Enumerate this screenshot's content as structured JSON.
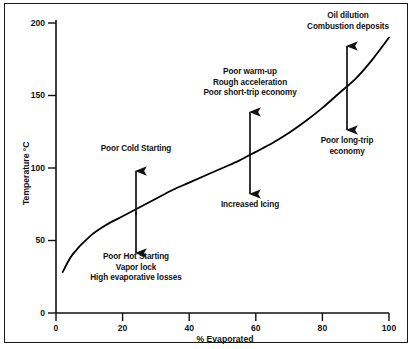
{
  "chart_data": {
    "type": "line",
    "title": "",
    "subtitle": "",
    "xlabel": "% Evaporated",
    "ylabel": "Temperature °C",
    "xlim": [
      0,
      100
    ],
    "ylim": [
      0,
      200
    ],
    "xticks": [
      0,
      20,
      40,
      60,
      80,
      100
    ],
    "yticks": [
      0,
      50,
      100,
      150,
      200
    ],
    "xtick_labels": [
      "0",
      "20",
      "40",
      "60",
      "80",
      "100"
    ],
    "ytick_labels": [
      "0",
      "50",
      "100",
      "150",
      "200"
    ],
    "grid": false,
    "legend": null,
    "series": [
      {
        "name": "Gasoline distillation curve",
        "color": "#000000",
        "x": [
          2,
          5,
          10,
          15,
          20,
          25,
          30,
          35,
          40,
          45,
          50,
          55,
          60,
          65,
          70,
          75,
          80,
          85,
          90,
          95,
          100
        ],
        "y": [
          28,
          40,
          52,
          60,
          66,
          72,
          78,
          84,
          89,
          94,
          99,
          104,
          110,
          116,
          123,
          131,
          140,
          150,
          160,
          173,
          188
        ]
      }
    ],
    "annotations": [
      {
        "id": "poor-cold-starting",
        "text": "Poor Cold Starting",
        "x": 23,
        "y": 130,
        "arrow": "up",
        "arrow_x": 23
      },
      {
        "id": "poor-hot-starting",
        "text": "Poor Hot Starting\nVapor lock\nHigh evaporative losses",
        "x": 23,
        "y": 22,
        "arrow": "down",
        "arrow_x": 23
      },
      {
        "id": "poor-warm-up",
        "text": "Poor warm-up\nRough acceleration\nPoor short-trip economy",
        "x": 58,
        "y": 158,
        "arrow": "up",
        "arrow_x": 58
      },
      {
        "id": "increased-icing",
        "text": "Increased Icing",
        "x": 58,
        "y": 62,
        "arrow": "down",
        "arrow_x": 58
      },
      {
        "id": "oil-dilution",
        "text": "Oil dilution\nCombustion deposits",
        "x": 90,
        "y": 196,
        "arrow": "up",
        "arrow_x": 90
      },
      {
        "id": "poor-long-trip-economy",
        "text": "Poor long-trip\neconomy",
        "x": 90,
        "y": 123,
        "arrow": "down",
        "arrow_x": 90
      }
    ]
  },
  "labels": {
    "y_axis_title": "Temperature °C",
    "x_axis_title": "% Evaporated",
    "y_ticks": [
      "200",
      "150",
      "100",
      "50",
      "0"
    ],
    "x_ticks": [
      "0",
      "20",
      "40",
      "60",
      "80",
      "100"
    ],
    "annotation_poor_cold_starting": "Poor Cold Starting",
    "annotation_poor_hot_starting_line1": "Poor Hot Starting",
    "annotation_poor_hot_starting_line2": "Vapor lock",
    "annotation_poor_hot_starting_line3": "High evaporative losses",
    "annotation_poor_warm_up_line1": "Poor warm-up",
    "annotation_poor_warm_up_line2": "Rough acceleration",
    "annotation_poor_warm_up_line3": "Poor short-trip economy",
    "annotation_increased_icing": "Increased Icing",
    "annotation_oil_dilution_line1": "Oil dilution",
    "annotation_oil_dilution_line2": "Combustion deposits",
    "annotation_poor_long_trip_line1": "Poor long-trip",
    "annotation_poor_long_trip_line2": "economy"
  },
  "colors": {
    "curve": "#000000",
    "axis": "#111111",
    "text": "#111111",
    "border": "#1a1a1a",
    "background": "#ffffff"
  }
}
